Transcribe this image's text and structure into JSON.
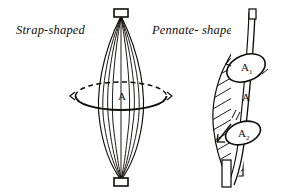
{
  "figure": {
    "background_color": "#ffffff",
    "ink_color": "#100d0c"
  },
  "labels": {
    "strap": "Strap-shaped",
    "pennate": "Pennate- shaped"
  },
  "diagrams": [
    {
      "name": "strap-shaped-muscle",
      "shape": "fusiform",
      "fiber_count": 7,
      "tendon_top": "rectangular tendon",
      "tendon_bottom": "rectangular tendon",
      "cross_section": {
        "style": "ellipse",
        "label": "A",
        "subscript": ""
      }
    },
    {
      "name": "pennate-shaped-muscle",
      "shape": "unipennate",
      "fiber_style": "oblique hatched fibers",
      "tendon": "vertical central tendon",
      "cross_sections": [
        {
          "label": "A",
          "subscript": "1",
          "position": "upper"
        },
        {
          "label": "A",
          "subscript": "2",
          "position": "lower"
        }
      ],
      "belly_label": {
        "label": "A",
        "subscript": ""
      }
    }
  ]
}
